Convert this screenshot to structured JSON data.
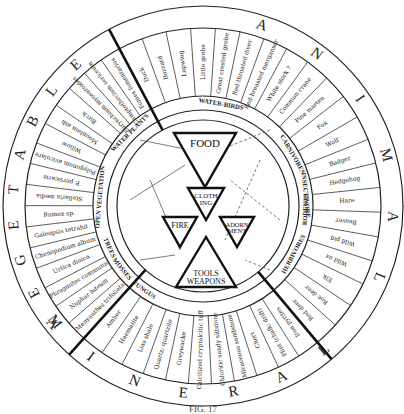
{
  "outer_labels": {
    "animal": "A N I M A L",
    "vegetable": "V E G E T A B L E",
    "mineral": "M I N E R A L"
  },
  "caption": "FIG. 17",
  "center": {
    "food": "FOOD",
    "clothing": [
      "CLOTH",
      "ING"
    ],
    "fire": "FIRE",
    "adornment": [
      "ADORN",
      "MENT"
    ],
    "tools_weapons": [
      "TOOLS",
      "WEAPONS"
    ]
  },
  "categories": {
    "water_birds": "WATER-BIRDS",
    "carnivores": "CARNIVORES",
    "insectivore": "INSECTIVORE",
    "rodents": "RODENTS",
    "herbivores": "HERBIVORES",
    "water_plants": [
      "WATER",
      "PLANTS"
    ],
    "open_vegetation": "OPEN VEGETATION",
    "trees": "TREES",
    "mosses": "MOSSES",
    "fungus": "FUNGUS"
  },
  "animal_items": [
    "Duck",
    "Buzzard",
    "Lapwing",
    "Little grebe",
    "Great crested grebe",
    "Red-throated diver",
    "Red-breasted merganser",
    "White stork ?",
    "Common crane",
    "Pine marten",
    "Fox",
    "Wolf",
    "Badger",
    "Hedgehog",
    "Hare",
    "Beaver",
    "Wild pig",
    "Wild ox",
    "Elk",
    "Roe deer",
    "Red deer"
  ],
  "vegetable_items": [
    "Menyanthes trifoliata",
    "Nuphar luteum",
    "Phragmites communis",
    "Urtica dioica",
    "Chenopodium album",
    "Galeopsis tetrahit",
    "Rumex sp.",
    "Stellaria media",
    "P. persicaria",
    "Polygonum aviculare",
    "Willow",
    "Mountain ash",
    "Birch",
    "Eurynchium myosuroides",
    "Camptothecium sericeum",
    "Fomes fomentarius"
  ],
  "mineral_items": [
    "Iron pyrites",
    "Flint (chalk; drift)",
    "Chert",
    "Micaceous sandstone",
    "Chloritic sandy siltstone",
    "Calcitized cryptalcitic tuff",
    "Greywacke",
    "Quartz; quartzite",
    "Lias shale",
    "Haematite",
    "Amber"
  ]
}
